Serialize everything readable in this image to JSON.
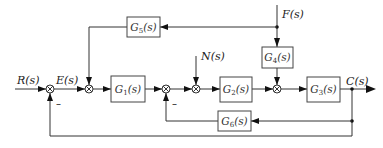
{
  "diagram": {
    "type": "control-system-block-diagram",
    "signals": {
      "input": "R(s)",
      "error": "E(s)",
      "disturbance_n": "N(s)",
      "disturbance_f": "F(s)",
      "output": "C(s)"
    },
    "blocks": {
      "g1": {
        "name": "G",
        "sub": "1",
        "tail": "(s)"
      },
      "g2": {
        "name": "G",
        "sub": "2",
        "tail": "(s)"
      },
      "g3": {
        "name": "G",
        "sub": "3",
        "tail": "(s)"
      },
      "g4": {
        "name": "G",
        "sub": "4",
        "tail": "(s)"
      },
      "g5": {
        "name": "G",
        "sub": "5",
        "tail": "(s)"
      },
      "g6": {
        "name": "G",
        "sub": "6",
        "tail": "(s)"
      }
    },
    "signs": {
      "sum1_bottom": "–",
      "sum3_bottom": "–"
    },
    "connections": [
      "R(s) -> sum1(+)",
      "sum1 -> E(s) -> sum2",
      "sum2 -> G1(s) -> sum3",
      "sum3 -> sum4",
      "N(s) -> sum4",
      "sum4 -> G2(s) -> sum5",
      "F(s) -> G4(s) -> sum5",
      "F(s) -> G5(s) -> sum2",
      "sum5 -> G3(s) -> C(s)",
      "C(s) -> G6(s) -> sum3(-)",
      "C(s) -> sum1(-)"
    ]
  }
}
